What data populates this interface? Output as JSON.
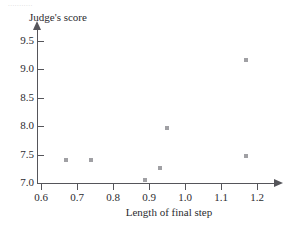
{
  "artifact_text": "...........",
  "chart_data": {
    "type": "scatter",
    "title": "",
    "xlabel": "Length of final step",
    "ylabel": "Judge's score",
    "xlim": [
      0.555,
      1.26
    ],
    "ylim": [
      6.96,
      9.66
    ],
    "xticks": [
      0.6,
      0.7,
      0.8,
      0.9,
      1.0,
      1.1,
      1.2
    ],
    "xtick_labels": [
      "0.6",
      "0.7",
      "0.8",
      "0.9",
      "1.0",
      "1.1",
      "1.2"
    ],
    "yticks": [
      7.0,
      7.5,
      8.0,
      8.5,
      9.0,
      9.5
    ],
    "ytick_labels": [
      "7.0",
      "7.5",
      "8.0",
      "8.5",
      "9.0",
      "9.5"
    ],
    "grid": false,
    "legend": false,
    "marker": "square",
    "marker_color": "#a0a0a4",
    "axis_color": "#55555a",
    "points": [
      {
        "x": 0.67,
        "y": 7.4
      },
      {
        "x": 0.74,
        "y": 7.4
      },
      {
        "x": 0.89,
        "y": 7.05
      },
      {
        "x": 0.93,
        "y": 7.26
      },
      {
        "x": 0.95,
        "y": 7.97
      },
      {
        "x": 1.17,
        "y": 9.16
      },
      {
        "x": 1.17,
        "y": 7.47
      }
    ]
  }
}
